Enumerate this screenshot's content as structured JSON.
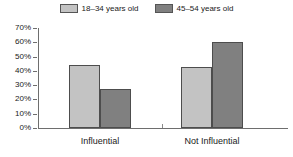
{
  "chart_data": {
    "type": "bar",
    "title": "",
    "subtitle": "",
    "xlabel": "",
    "ylabel": "",
    "categories": [
      "Influential",
      "Not Influential"
    ],
    "series": [
      {
        "name": "18–34 years old",
        "values": [
          44,
          43
        ],
        "color": "#c3c3c3"
      },
      {
        "name": "45–54 years old",
        "values": [
          27,
          60
        ],
        "color": "#808080"
      }
    ],
    "ylim": [
      0,
      70
    ],
    "ytick_values": [
      70,
      60,
      50,
      40,
      30,
      20,
      10,
      0
    ],
    "ytick_labels": [
      "70%",
      "60%",
      "50%",
      "40%",
      "30%",
      "20%",
      "10%",
      "0%"
    ],
    "value_format": "percent",
    "grid": false,
    "legend_position": "top-center",
    "annotations": []
  },
  "legend": {
    "entries": [
      {
        "label": "18–34 years old",
        "color": "#c3c3c3"
      },
      {
        "label": "45–54 years old",
        "color": "#808080"
      }
    ]
  }
}
